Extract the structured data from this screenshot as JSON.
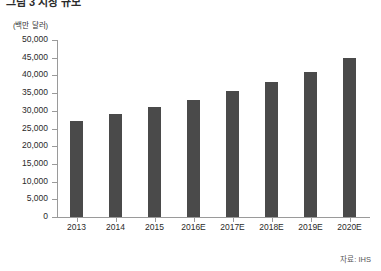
{
  "title": "그림 3 시장 규모",
  "unit_label": "(백만 달러)",
  "source_note": "자료: IHS",
  "colors": {
    "bar": "#4a4a4a",
    "axis": "#9a9a9a",
    "text": "#2a2a2a",
    "background": "#ffffff"
  },
  "chart_data": {
    "type": "bar",
    "title": "그림 3 시장 규모",
    "xlabel": "",
    "ylabel": "(백만 달러)",
    "ylim": [
      0,
      50000
    ],
    "ytick_step": 5000,
    "ytick_labels": [
      "50,000",
      "45,000",
      "40,000",
      "35,000",
      "30,000",
      "25,000",
      "20,000",
      "15,000",
      "10,000",
      "5,000",
      "0"
    ],
    "ytick_values": [
      50000,
      45000,
      40000,
      35000,
      30000,
      25000,
      20000,
      15000,
      10000,
      5000,
      0
    ],
    "grid": false,
    "legend": "none",
    "categories": [
      "2013",
      "2014",
      "2015",
      "2016E",
      "2017E",
      "2018E",
      "2019E",
      "2020E"
    ],
    "values": [
      27000,
      29000,
      31000,
      33000,
      35500,
      38000,
      41000,
      45000
    ],
    "source": "IHS"
  }
}
